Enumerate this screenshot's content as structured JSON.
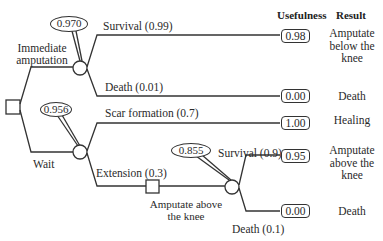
{
  "headers": {
    "usefulness": "Usefulness",
    "result": "Result"
  },
  "decision_root": {
    "options": [
      {
        "label_line1": "Immediate",
        "label_line2": "amputation",
        "expected_value": "0.970",
        "outcomes": [
          {
            "label": "Survival  (0.99)",
            "usefulness": "0.98",
            "result_lines": [
              "Amputate",
              "below the",
              "knee"
            ]
          },
          {
            "label": "Death   (0.01)",
            "usefulness": "0.00",
            "result_lines": [
              "Death"
            ]
          }
        ]
      },
      {
        "label": "Wait",
        "expected_value": "0.956",
        "outcomes": [
          {
            "label": "Scar formation  (0.7)",
            "usefulness": "1.00",
            "result_lines": [
              "Healing"
            ]
          },
          {
            "label": "Extension  (0.3)",
            "subdecision": {
              "label_line1": "Amputate above",
              "label_line2": "the knee",
              "expected_value": "0.855",
              "outcomes": [
                {
                  "label": "Survival  (0.9)",
                  "usefulness": "0.95",
                  "result_lines": [
                    "Amputate",
                    "above the",
                    "knee"
                  ]
                },
                {
                  "label": "Death    (0.1)",
                  "usefulness": "0.00",
                  "result_lines": [
                    "Death"
                  ]
                }
              ]
            }
          }
        ]
      }
    ]
  },
  "colors": {
    "line": "#333333",
    "text": "#2a2a2a",
    "background": "#ffffff"
  }
}
